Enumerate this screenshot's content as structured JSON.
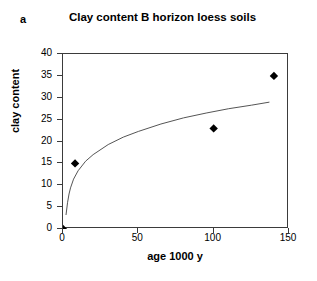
{
  "figure": {
    "panel_label": "a"
  },
  "chart_data": {
    "type": "scatter",
    "title": "Clay content B horizon loess soils",
    "xlabel": "age 1000 y",
    "ylabel": "clay content",
    "xlim": [
      0,
      150
    ],
    "ylim": [
      0,
      40
    ],
    "xticks": [
      0,
      50,
      100,
      150
    ],
    "yticks": [
      0,
      5,
      10,
      15,
      20,
      25,
      30,
      35,
      40
    ],
    "grid": false,
    "legend": null,
    "marker": "filled-diamond",
    "marker_color": "#000000",
    "trendline_color": "#555555",
    "series": [
      {
        "name": "B horizon clay content",
        "points": [
          {
            "x": 0,
            "y": 0
          },
          {
            "x": 8,
            "y": 15
          },
          {
            "x": 100,
            "y": 23
          },
          {
            "x": 140,
            "y": 35
          }
        ]
      }
    ],
    "trendline": {
      "type": "logarithmic",
      "points": [
        {
          "x": 2,
          "y": 3.2
        },
        {
          "x": 3,
          "y": 6.0
        },
        {
          "x": 4,
          "y": 8.0
        },
        {
          "x": 5,
          "y": 9.4
        },
        {
          "x": 7,
          "y": 11.4
        },
        {
          "x": 10,
          "y": 13.3
        },
        {
          "x": 15,
          "y": 15.5
        },
        {
          "x": 20,
          "y": 17.0
        },
        {
          "x": 30,
          "y": 19.3
        },
        {
          "x": 40,
          "y": 21.0
        },
        {
          "x": 50,
          "y": 22.3
        },
        {
          "x": 65,
          "y": 24.0
        },
        {
          "x": 80,
          "y": 25.4
        },
        {
          "x": 95,
          "y": 26.5
        },
        {
          "x": 110,
          "y": 27.5
        },
        {
          "x": 125,
          "y": 28.3
        },
        {
          "x": 137,
          "y": 29.0
        }
      ]
    }
  }
}
